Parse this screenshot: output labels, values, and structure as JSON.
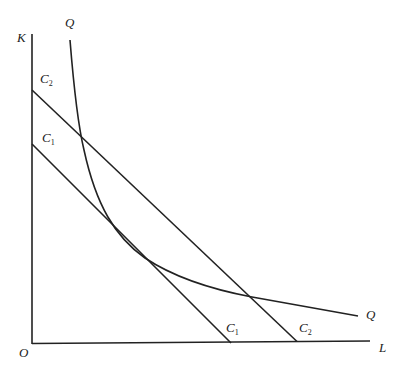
{
  "diagram": {
    "type": "isoquant-isocost",
    "axes": {
      "y_label": "K",
      "x_label": "L",
      "origin_label": "O"
    },
    "isoquant": {
      "label_top": "Q",
      "label_right": "Q"
    },
    "isocost_lines": [
      {
        "name": "C",
        "sub": "1",
        "label_axis": "C",
        "label_axis_sub": "1"
      },
      {
        "name": "C",
        "sub": "2",
        "label_axis": "C",
        "label_axis_sub": "2"
      }
    ],
    "colors": {
      "line": "#222222",
      "background": "#ffffff"
    }
  }
}
